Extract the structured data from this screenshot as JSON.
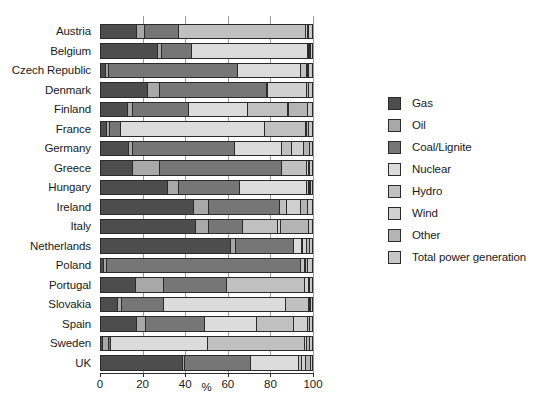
{
  "chart_data": {
    "type": "bar",
    "orientation": "horizontal",
    "stacked": true,
    "title": "",
    "xlabel": "%",
    "ylabel": "",
    "xlim": [
      0,
      100
    ],
    "xticks": [
      0,
      20,
      40,
      60,
      80,
      100
    ],
    "xticklabels": [
      "0",
      "20",
      "40",
      "60",
      "80",
      "100"
    ],
    "grid": true,
    "legend_position": "right",
    "categories": [
      "Austria",
      "Belgium",
      "Czech Republic",
      "Denmark",
      "Finland",
      "France",
      "Germany",
      "Greece",
      "Hungary",
      "Ireland",
      "Italy",
      "Netherlands",
      "Poland",
      "Portugal",
      "Slovakia",
      "Spain",
      "Sweden",
      "UK"
    ],
    "series": [
      {
        "name": "Gas",
        "color": "#4d4d4d",
        "values": [
          17.0,
          27.0,
          2.5,
          22.5,
          13.0,
          3.0,
          13.5,
          15.0,
          32.0,
          44.0,
          45.0,
          62.0,
          1.5,
          16.5,
          8.0,
          17.0,
          0.8,
          39.0
        ]
      },
      {
        "name": "Oil",
        "color": "#a8a8a8",
        "values": [
          4.0,
          2.0,
          1.5,
          5.5,
          2.0,
          1.5,
          1.5,
          13.0,
          5.0,
          7.0,
          6.0,
          2.0,
          1.5,
          13.5,
          2.0,
          4.5,
          3.0,
          1.0
        ]
      },
      {
        "name": "Coal/Lignite",
        "color": "#767676",
        "values": [
          16.0,
          14.0,
          61.0,
          51.0,
          27.0,
          5.0,
          48.5,
          58.0,
          29.0,
          34.0,
          16.5,
          27.5,
          92.0,
          29.5,
          20.0,
          28.0,
          1.0,
          31.0
        ]
      },
      {
        "name": "Nuclear",
        "color": "#dcdcdc",
        "values": [
          0.0,
          55.0,
          30.0,
          0.0,
          28.0,
          68.5,
          22.5,
          0.0,
          32.0,
          0.0,
          0.0,
          4.0,
          0.0,
          0.0,
          58.0,
          24.5,
          46.0,
          23.0
        ]
      },
      {
        "name": "Hydro",
        "color": "#c0c0c0",
        "values": [
          60.0,
          0.5,
          3.0,
          0.2,
          19.0,
          19.5,
          4.5,
          11.5,
          0.7,
          3.0,
          16.5,
          0.2,
          2.0,
          37.0,
          11.0,
          17.5,
          46.0,
          1.5
        ]
      },
      {
        "name": "Wind",
        "color": "#d0d0d0",
        "values": [
          1.0,
          0.5,
          0.2,
          18.5,
          0.2,
          0.3,
          5.5,
          1.0,
          0.3,
          7.0,
          1.5,
          2.0,
          0.2,
          2.0,
          0.2,
          6.5,
          0.8,
          1.5
        ]
      },
      {
        "name": "Other",
        "color": "#b4b4b4",
        "values": [
          0.5,
          0.5,
          0.5,
          1.0,
          9.0,
          1.0,
          3.0,
          0.5,
          0.5,
          3.0,
          13.0,
          1.5,
          1.0,
          0.5,
          0.5,
          1.0,
          1.5,
          2.5
        ]
      },
      {
        "name": "Total power generation",
        "color": "#c8c8c8",
        "values": [
          1.5,
          0.5,
          1.3,
          1.3,
          1.8,
          1.2,
          1.0,
          1.0,
          0.5,
          2.0,
          1.5,
          0.8,
          1.8,
          1.0,
          0.3,
          1.0,
          0.9,
          0.5
        ]
      }
    ]
  },
  "legend": {
    "items": [
      {
        "label": "Gas"
      },
      {
        "label": "Oil"
      },
      {
        "label": "Coal/Lignite"
      },
      {
        "label": "Nuclear"
      },
      {
        "label": "Hydro"
      },
      {
        "label": "Wind"
      },
      {
        "label": "Other"
      },
      {
        "label": "Total power generation"
      }
    ]
  }
}
